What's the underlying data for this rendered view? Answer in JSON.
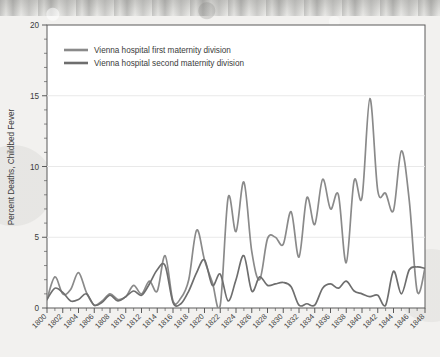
{
  "chart_data": {
    "type": "line",
    "title": "",
    "xlabel": "",
    "ylabel": "Percent Deaths, Childbed Fever",
    "xlim": [
      1800,
      1848
    ],
    "ylim": [
      0,
      20
    ],
    "grid": true,
    "legend_position": "top-left",
    "y_ticks": [
      0,
      5,
      10,
      15,
      20
    ],
    "y_tick_labels": [
      "0",
      "5",
      "10",
      "15",
      "20"
    ],
    "x_tick_labels": [
      "1800",
      "1802",
      "1804",
      "1806",
      "1808",
      "1810",
      "1812",
      "1814",
      "1816",
      "1818",
      "1820",
      "1822",
      "1824",
      "1826",
      "1828",
      "1830",
      "1832",
      "1834",
      "1836",
      "1838",
      "1840",
      "1842",
      "1844",
      "1846",
      "1848"
    ],
    "x_minor_tick_interval": 1,
    "x": [
      1800,
      1801,
      1802,
      1803,
      1804,
      1805,
      1806,
      1807,
      1808,
      1809,
      1810,
      1811,
      1812,
      1813,
      1814,
      1815,
      1816,
      1817,
      1818,
      1819,
      1820,
      1821,
      1822,
      1823,
      1824,
      1825,
      1826,
      1827,
      1828,
      1829,
      1830,
      1831,
      1832,
      1833,
      1834,
      1835,
      1836,
      1837,
      1838,
      1839,
      1840,
      1841,
      1842,
      1843,
      1844,
      1845,
      1846,
      1847,
      1848
    ],
    "series": [
      {
        "name": "Vienna hospital first maternity division",
        "color": "#8a8a8a",
        "values": [
          0.6,
          2.2,
          1.0,
          1.3,
          2.5,
          1.1,
          0.2,
          0.5,
          1.0,
          0.6,
          0.8,
          1.6,
          1.0,
          1.9,
          1.2,
          3.7,
          0.5,
          0.7,
          2.0,
          5.5,
          3.4,
          1.8,
          0.2,
          7.8,
          5.4,
          8.9,
          4.0,
          2.0,
          4.9,
          5.0,
          4.5,
          6.8,
          3.6,
          7.8,
          5.9,
          9.1,
          7.0,
          8.0,
          3.2,
          9.0,
          7.8,
          14.8,
          8.3,
          8.1,
          6.9,
          11.1,
          7.6,
          1.2,
          2.8
        ]
      },
      {
        "name": "Vienna hospital second maternity division",
        "color": "#6e6e6e",
        "values": [
          0.6,
          1.4,
          1.1,
          0.5,
          0.6,
          1.0,
          0.2,
          0.4,
          0.9,
          0.5,
          0.8,
          1.2,
          0.9,
          1.7,
          2.7,
          3.0,
          0.4,
          0.3,
          1.2,
          2.5,
          3.4,
          1.6,
          2.4,
          0.5,
          2.0,
          3.7,
          1.2,
          2.2,
          1.6,
          1.7,
          1.8,
          1.5,
          0.2,
          0.3,
          0.2,
          1.4,
          1.7,
          1.4,
          1.9,
          1.2,
          1.0,
          0.8,
          0.9,
          0.2,
          2.6,
          1.0,
          2.7,
          2.9,
          2.8
        ]
      }
    ]
  },
  "legend": {
    "items": [
      {
        "label": "Vienna hospital first maternity division"
      },
      {
        "label": "Vienna hospital second maternity division"
      }
    ]
  }
}
